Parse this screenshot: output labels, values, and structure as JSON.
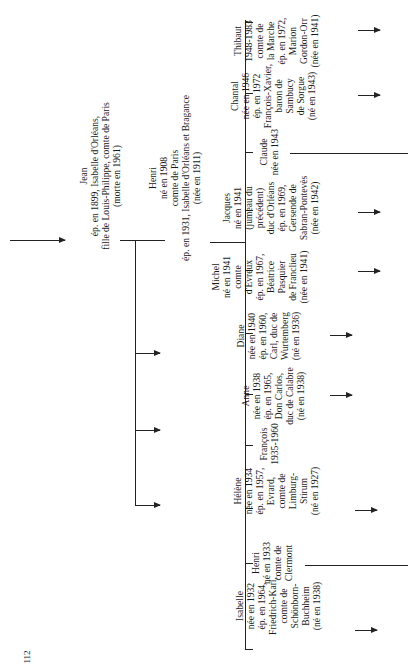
{
  "page_number": "112",
  "root": {
    "lines": [
      "Jean",
      "ép. en 1899, Isabelle d'Orléans,",
      "fille de Louis-Philippe, comte de Paris",
      "(morte en 1961)"
    ]
  },
  "parent": {
    "lines": [
      "Henri",
      "né en 1908",
      "comte de Paris",
      "ép. en 1931, Isabelle d'Orléans et Bragance",
      "(née en 1911)"
    ]
  },
  "children": [
    {
      "lines": [
        "Isabelle",
        "née en 1932",
        "ép. en 1964,",
        "Friedrich-Karl,",
        "comte de",
        "Schönborn-",
        "Buchheim",
        "(né en 1938)"
      ]
    },
    {
      "lines": [
        "Henri",
        "né en 1933",
        "comte de",
        "Clermont"
      ]
    },
    {
      "lines": [
        "Hélène",
        "née en 1934",
        "ép. en 1957,",
        "Evrard,",
        "comte de",
        "Limburg-",
        "Stirum",
        "(né en 1927)"
      ]
    },
    {
      "lines": [
        "François",
        "1935-1960"
      ]
    },
    {
      "lines": [
        "Anne",
        "née en 1938",
        "ép. en 1965,",
        "Don Carlos,",
        "duc de Calabre",
        "(né en 1938)"
      ]
    },
    {
      "lines": [
        "Diane",
        "née en 1940",
        "ép. en 1960,",
        "Carl, duc de",
        "Wurtemberg",
        "(né en 1936)"
      ]
    },
    {
      "lines": [
        "Michel",
        "né en 1941",
        "comte",
        "d'Evreux",
        "ép. en 1967,",
        "Béatrice",
        "Pasquier",
        "de Franclieu",
        "(née en 1941)"
      ]
    },
    {
      "lines": [
        "Jacques",
        "né en 1941",
        "(jumeau du",
        "précédent)",
        "duc d'Orléans",
        "ép. en 1969,",
        "Gersende de",
        "Sabran-Pontevès",
        "(née en 1942)"
      ]
    },
    {
      "lines": [
        "Claude",
        "née en 1943"
      ]
    },
    {
      "lines": [
        "Chantal",
        "née en 1946",
        "ép. en 1972",
        "François-Xavier,",
        "baron de",
        "Sambucy",
        "de Sorgue",
        "(né en 1943)"
      ]
    },
    {
      "lines": [
        "Thibaut",
        "1948-1983",
        "comte de",
        "la Marche",
        "ép. en 1972,",
        "Marion",
        "Gordon-Orr",
        "(née en 1941)"
      ]
    }
  ]
}
